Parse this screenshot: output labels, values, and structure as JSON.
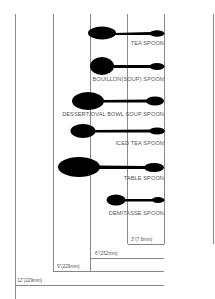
{
  "diagram": {
    "title": "",
    "grid_lines_x": [
      15,
      53,
      90,
      127,
      164,
      213
    ],
    "colors": {
      "spoon": "#000000",
      "line": "#8a8a8a",
      "text": "#555555"
    },
    "spoons": [
      {
        "name": "TEA SPOON",
        "label": "TEA SPOON"
      },
      {
        "name": "BOUILLON(SOUP) SPOON",
        "label": "BOUILLON(SOUP) SPOON"
      },
      {
        "name": "DESSERT/OVAL BOWL SOUP SPOON",
        "label": "DESSERT/OVAL BOWL SOUP SPOON"
      },
      {
        "name": "ICED TEA SPOON",
        "label": "ICED TEA SPOON"
      },
      {
        "name": "TABLE SPOON",
        "label": "TABLE SPOON"
      },
      {
        "name": "DEMITASSE SPOON",
        "label": "DEMITASSE SPOON"
      }
    ],
    "scale": [
      {
        "label": "3\"(7.6mm)"
      },
      {
        "label": "6\"(152mm)"
      },
      {
        "label": "9\"(229mm)"
      },
      {
        "label": "12\"(229mm)"
      }
    ]
  }
}
